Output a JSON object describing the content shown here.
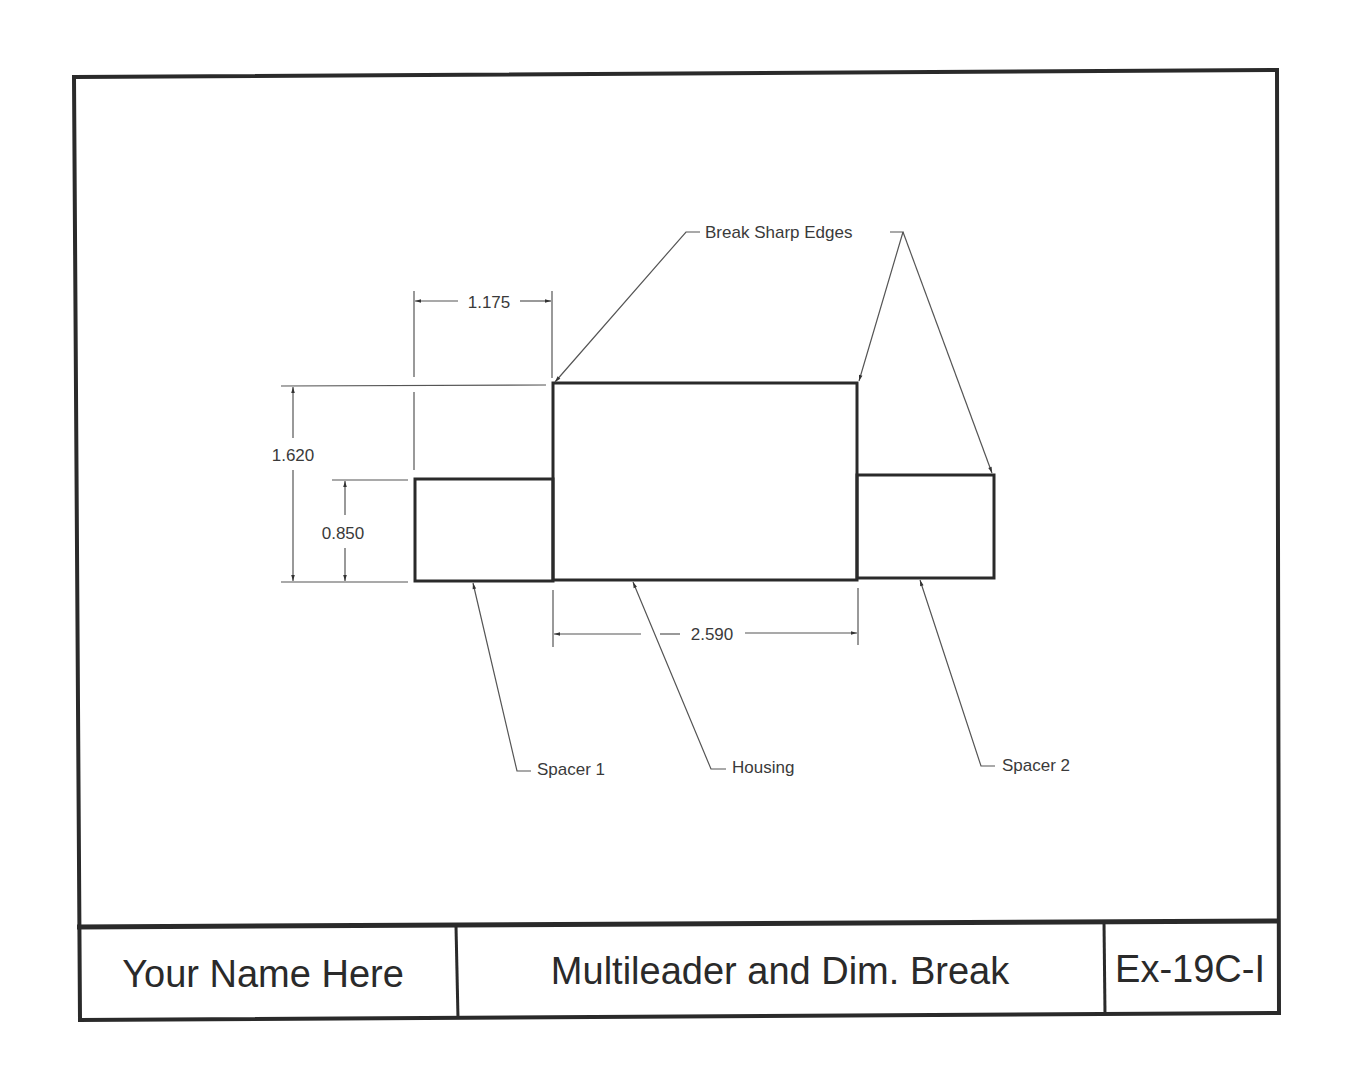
{
  "drawing": {
    "dimensions": {
      "top_width": "1.175",
      "overall_height": "1.620",
      "spacer_height": "0.850",
      "housing_width": "2.590"
    },
    "leaders": {
      "break_edges": "Break Sharp Edges",
      "spacer1": "Spacer 1",
      "housing": "Housing",
      "spacer2": "Spacer 2"
    },
    "parts": [
      "Spacer 1",
      "Housing",
      "Spacer 2"
    ]
  },
  "title_block": {
    "name": "Your Name Here",
    "title": "Multileader and Dim. Break",
    "number": "Ex-19C-I"
  },
  "colors": {
    "line": "#2a2a2a",
    "thin": "#555555",
    "background": "#ffffff"
  }
}
